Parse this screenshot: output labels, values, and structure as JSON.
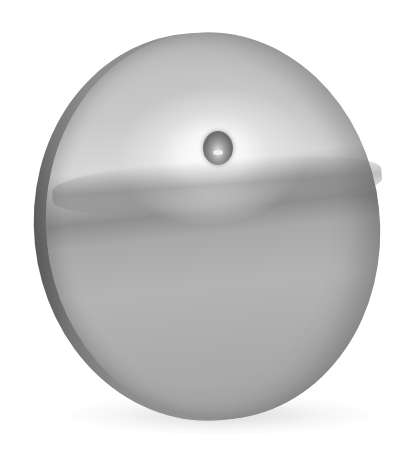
{
  "image": {
    "subject": "Polished metal disc with small central hole, standing on edge",
    "background_color": "#ffffff",
    "colors": {
      "highlight": "#ffffff",
      "face_mid": "#b4b4b4",
      "rim_dark": "#5a5a5a",
      "hole_dark": "#6d6d6d"
    }
  }
}
